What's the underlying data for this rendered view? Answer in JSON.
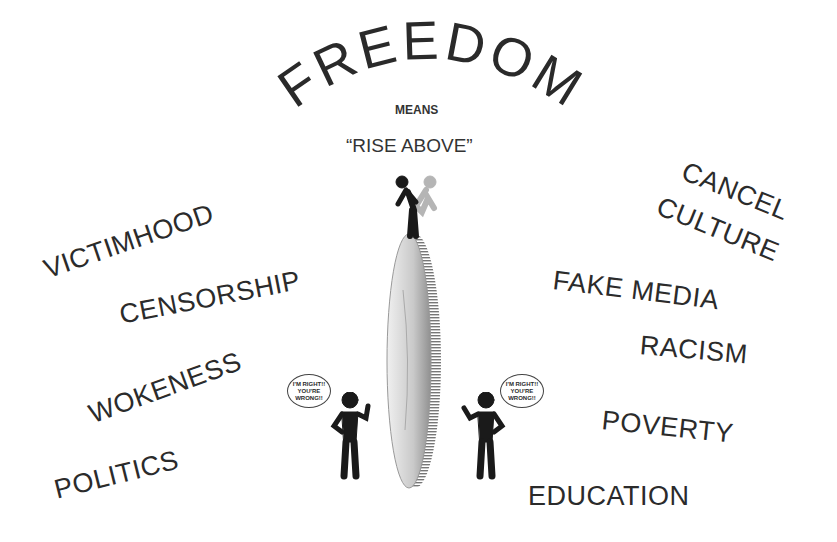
{
  "title": {
    "arc_text": "FREEDOM",
    "means": "MEANS",
    "subtitle": "“RISE ABOVE”"
  },
  "left_words": [
    {
      "text": "VICTIMHOOD"
    },
    {
      "text": "CENSORSHIP"
    },
    {
      "text": "WOKENESS"
    },
    {
      "text": "POLITICS"
    }
  ],
  "right_words": [
    {
      "text": "CANCEL"
    },
    {
      "text": "CULTURE"
    },
    {
      "text": "FAKE MEDIA"
    },
    {
      "text": "RACISM"
    },
    {
      "text": "POVERTY"
    },
    {
      "text": "EDUCATION"
    }
  ],
  "speech_bubbles": [
    {
      "text": "I'M RIGHT!! YOU'RE WRONG!!"
    },
    {
      "text": "I'M RIGHT!! YOU'RE WRONG!!"
    }
  ],
  "colors": {
    "text": "#2b2b2b",
    "figure": "#1a1a1a",
    "coin": "#d9d9d9"
  }
}
